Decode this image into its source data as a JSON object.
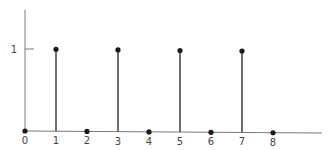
{
  "chart_data": {
    "type": "stem",
    "title": "",
    "xlabel": "",
    "ylabel": "",
    "x": [
      0,
      1,
      2,
      3,
      4,
      5,
      6,
      7,
      8
    ],
    "values": [
      0,
      1,
      0,
      1,
      0,
      1,
      0,
      1,
      0
    ],
    "x_tick_labels": [
      "0",
      "1",
      "2",
      "3",
      "4",
      "5",
      "6",
      "7",
      "8"
    ],
    "y_tick_labels": [
      "1"
    ],
    "y_ticks": [
      1
    ],
    "xlim": [
      0,
      9.5
    ],
    "ylim": [
      0,
      2.1
    ],
    "grid": false,
    "legend": null
  },
  "colors": {
    "axis": "#7a7a7a",
    "stem": "#4a4a4a",
    "marker": "#1a1a1a",
    "label": "#444444"
  },
  "layout": {
    "origin_x": 25,
    "baseline_y": 131,
    "unit_x": 31,
    "unit_y": 82,
    "axis_top_y": 10,
    "axis_right_x": 322
  }
}
